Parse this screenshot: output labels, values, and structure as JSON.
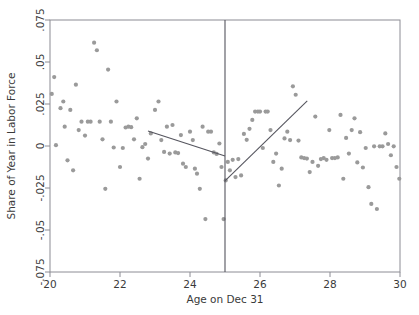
{
  "chart_data": {
    "type": "scatter",
    "title": "",
    "xlabel": "Age on Dec 31",
    "ylabel": "Share of Year in Labor Force",
    "xlim": [
      20,
      30
    ],
    "ylim": [
      -0.075,
      0.075
    ],
    "xticks": [
      20,
      22,
      24,
      26,
      28,
      30
    ],
    "xticklabels": [
      "20",
      "22",
      "24",
      "26",
      "28",
      "30"
    ],
    "yticks": [
      0.075,
      0.05,
      0.025,
      0,
      -0.025,
      -0.05,
      -0.075
    ],
    "yticklabels": [
      ".075",
      ".05",
      ".025",
      "0",
      "-.025",
      "-.05",
      "-.075"
    ],
    "grid": false,
    "legend": null,
    "point_color": "#9a9a9a",
    "line_color": "#55555e",
    "frame_color": "#8c8c94",
    "cutoff": {
      "x": 25,
      "label": "",
      "color": "#55555e"
    },
    "series": [
      {
        "name": "Share of year in labor force by age bin",
        "marker": "circle",
        "color": "#9a9a9a",
        "points": [
          [
            20.05,
            0.031
          ],
          [
            20.12,
            0.041
          ],
          [
            20.17,
            0.0005
          ],
          [
            20.3,
            0.0225
          ],
          [
            20.38,
            0.0265
          ],
          [
            20.42,
            0.0115
          ],
          [
            20.5,
            -0.0085
          ],
          [
            20.58,
            0.0215
          ],
          [
            20.66,
            -0.0145
          ],
          [
            20.74,
            0.0365
          ],
          [
            20.82,
            0.0095
          ],
          [
            20.9,
            0.0145
          ],
          [
            21.0,
            0.0062
          ],
          [
            21.08,
            0.0145
          ],
          [
            21.16,
            0.0145
          ],
          [
            21.26,
            0.0615
          ],
          [
            21.34,
            0.057
          ],
          [
            21.42,
            0.0145
          ],
          [
            21.5,
            0.004
          ],
          [
            21.58,
            -0.0255
          ],
          [
            21.66,
            0.0455
          ],
          [
            21.74,
            0.0145
          ],
          [
            21.82,
            -0.0009
          ],
          [
            21.9,
            0.0265
          ],
          [
            22.0,
            -0.0125
          ],
          [
            22.08,
            -0.0012
          ],
          [
            22.16,
            0.011
          ],
          [
            22.24,
            0.0115
          ],
          [
            22.32,
            0.0112
          ],
          [
            22.4,
            0.004
          ],
          [
            22.48,
            0.0165
          ],
          [
            22.56,
            -0.0195
          ],
          [
            22.64,
            -0.0007
          ],
          [
            22.72,
            0.0012
          ],
          [
            22.8,
            -0.0075
          ],
          [
            22.88,
            0.0075
          ],
          [
            23.0,
            0.0215
          ],
          [
            23.1,
            0.0265
          ],
          [
            23.18,
            0.0035
          ],
          [
            23.26,
            -0.0035
          ],
          [
            23.34,
            0.0115
          ],
          [
            23.42,
            -0.0045
          ],
          [
            23.5,
            0.0125
          ],
          [
            23.58,
            -0.0038
          ],
          [
            23.66,
            -0.0042
          ],
          [
            23.74,
            0.0065
          ],
          [
            23.8,
            -0.0105
          ],
          [
            23.88,
            -0.0125
          ],
          [
            24.0,
            0.0085
          ],
          [
            24.08,
            0.0035
          ],
          [
            24.14,
            -0.0135
          ],
          [
            24.2,
            -0.0165
          ],
          [
            24.28,
            -0.0255
          ],
          [
            24.36,
            0.0115
          ],
          [
            24.44,
            -0.0435
          ],
          [
            24.52,
            0.0085
          ],
          [
            24.6,
            0.0085
          ],
          [
            24.68,
            -0.0038
          ],
          [
            24.76,
            -0.0047
          ],
          [
            24.84,
            0.0015
          ],
          [
            24.9,
            -0.0125
          ],
          [
            24.96,
            -0.0435
          ],
          [
            25.02,
            -0.0205
          ],
          [
            25.08,
            -0.0095
          ],
          [
            25.14,
            -0.0145
          ],
          [
            25.22,
            -0.0082
          ],
          [
            25.3,
            -0.0185
          ],
          [
            25.38,
            -0.0078
          ],
          [
            25.46,
            -0.0175
          ],
          [
            25.54,
            0.0072
          ],
          [
            25.62,
            0.0037
          ],
          [
            25.7,
            0.0102
          ],
          [
            25.78,
            0.0155
          ],
          [
            25.86,
            0.0205
          ],
          [
            25.94,
            0.0205
          ],
          [
            26.0,
            0.0205
          ],
          [
            26.08,
            -0.0012
          ],
          [
            26.16,
            0.0205
          ],
          [
            26.22,
            0.0205
          ],
          [
            26.3,
            0.0095
          ],
          [
            26.38,
            -0.0095
          ],
          [
            26.46,
            -0.0045
          ],
          [
            26.54,
            -0.0235
          ],
          [
            26.62,
            -0.0135
          ],
          [
            26.7,
            0.0045
          ],
          [
            26.78,
            0.0085
          ],
          [
            26.86,
            0.0035
          ],
          [
            26.94,
            0.0355
          ],
          [
            27.02,
            0.0305
          ],
          [
            27.1,
            0.0032
          ],
          [
            27.18,
            -0.0068
          ],
          [
            27.26,
            -0.0072
          ],
          [
            27.34,
            -0.0075
          ],
          [
            27.42,
            -0.0155
          ],
          [
            27.5,
            -0.0095
          ],
          [
            27.58,
            0.0175
          ],
          [
            27.66,
            -0.0118
          ],
          [
            27.74,
            -0.0078
          ],
          [
            27.82,
            -0.0072
          ],
          [
            27.9,
            -0.0082
          ],
          [
            27.98,
            0.0095
          ],
          [
            28.06,
            -0.0072
          ],
          [
            28.14,
            -0.0072
          ],
          [
            28.22,
            -0.0068
          ],
          [
            28.3,
            0.0185
          ],
          [
            28.38,
            -0.0195
          ],
          [
            28.46,
            0.0048
          ],
          [
            28.54,
            -0.0045
          ],
          [
            28.62,
            0.0095
          ],
          [
            28.7,
            0.0165
          ],
          [
            28.78,
            -0.0098
          ],
          [
            28.86,
            0.0082
          ],
          [
            28.94,
            -0.0128
          ],
          [
            29.02,
            -0.0012
          ],
          [
            29.1,
            -0.0245
          ],
          [
            29.18,
            -0.0345
          ],
          [
            29.26,
            -0.0002
          ],
          [
            29.34,
            -0.0375
          ],
          [
            29.42,
            -0.0002
          ],
          [
            29.5,
            -0.0002
          ],
          [
            29.58,
            0.0075
          ],
          [
            29.66,
            0.0012
          ],
          [
            29.74,
            -0.0055
          ],
          [
            29.82,
            -0.0002
          ],
          [
            29.9,
            -0.0125
          ],
          [
            29.98,
            -0.0195
          ]
        ]
      }
    ],
    "fit_lines": [
      {
        "name": "left-fit-line",
        "side": "left",
        "x": [
          22.8,
          25.0
        ],
        "y": [
          0.0089,
          -0.0059
        ],
        "color": "#55555e"
      },
      {
        "name": "right-fit-line",
        "side": "right",
        "x": [
          25.0,
          27.35
        ],
        "y": [
          -0.0208,
          0.0268
        ],
        "color": "#55555e"
      }
    ]
  },
  "figure": {
    "background": "#ffffff",
    "plot_area": {
      "left": 50,
      "top": 20,
      "right": 400,
      "bottom": 272
    }
  }
}
